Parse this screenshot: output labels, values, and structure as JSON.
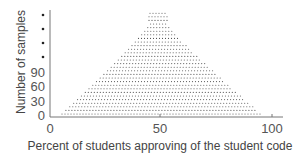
{
  "chart_data": {
    "type": "dot-plot",
    "title": "",
    "xlabel": "Percent of students approving of the student code",
    "ylabel": "Number of samples",
    "x_ticks": [
      "0",
      "50",
      "100"
    ],
    "y_ticks": [
      "0",
      "30",
      "60",
      "90"
    ],
    "y_axis_break_dots": 4,
    "xlim": [
      0,
      100
    ],
    "grid": false,
    "legend": null,
    "x": [
      5,
      10,
      15,
      20,
      25,
      30,
      35,
      40,
      45,
      50,
      55,
      60,
      65,
      70,
      75,
      80,
      85,
      90,
      95
    ],
    "values": [
      10,
      20,
      30,
      45,
      60,
      75,
      95,
      115,
      140,
      160,
      140,
      115,
      95,
      75,
      60,
      45,
      30,
      20,
      10
    ]
  },
  "axis": {
    "x_label": "Percent of students approving of the student code",
    "y_label": "Number of samples",
    "x_ticks": [
      {
        "label": "0",
        "px": 50
      },
      {
        "label": "50",
        "px": 160
      },
      {
        "label": "100",
        "px": 272
      }
    ],
    "y_ticks": [
      {
        "label": "0",
        "py": 116
      },
      {
        "label": "30",
        "py": 102
      },
      {
        "label": "60",
        "py": 87
      },
      {
        "label": "90",
        "py": 72
      }
    ]
  }
}
